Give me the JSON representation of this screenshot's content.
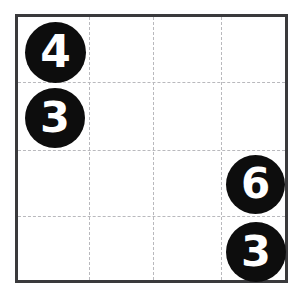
{
  "puzzle": {
    "title": "number-grid-puzzle",
    "grid": {
      "rows": 4,
      "cols": 4,
      "border_color": "#3a3a3c",
      "gridline_color": "#b9b9bd",
      "gridline_style": "dashed",
      "background_color": "#ffffff"
    },
    "token_style": {
      "fill_color": "#0d0d0d",
      "text_color": "#ffffff",
      "shape": "circle"
    },
    "tokens": [
      {
        "value": "4",
        "row": 0,
        "col": 0,
        "left": 7,
        "top": 5,
        "size": 61
      },
      {
        "value": "3",
        "row": 1,
        "col": 0,
        "left": 7,
        "top": 71,
        "size": 60
      },
      {
        "value": "6",
        "row": 2,
        "col": 3,
        "left": 208,
        "top": 138,
        "size": 59
      },
      {
        "value": "3",
        "row": 3,
        "col": 3,
        "left": 208,
        "top": 205,
        "size": 60
      }
    ],
    "gridlines": {
      "vertical": [
        71,
        135,
        203
      ],
      "horizontal": [
        65,
        133,
        199
      ]
    }
  }
}
